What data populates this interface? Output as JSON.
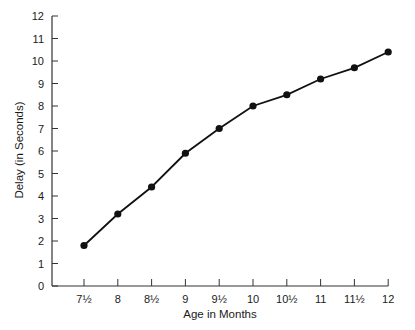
{
  "chart_data": {
    "type": "line",
    "title": "",
    "xlabel": "Age in Months",
    "ylabel": "Delay (in Seconds)",
    "x": [
      7.5,
      8,
      8.5,
      9,
      9.5,
      10,
      10.5,
      11,
      11.5,
      12
    ],
    "categories": [
      "7½",
      "8",
      "8½",
      "9",
      "9½",
      "10",
      "10½",
      "11",
      "11½",
      "12"
    ],
    "series": [
      {
        "name": "Delay",
        "values": [
          1.8,
          3.2,
          4.4,
          5.9,
          7.0,
          8.0,
          8.5,
          9.2,
          9.7,
          10.4
        ]
      }
    ],
    "ylim": [
      0,
      12
    ],
    "yticks": [
      0,
      1,
      2,
      3,
      4,
      5,
      6,
      7,
      8,
      9,
      10,
      11,
      12
    ],
    "grid": false,
    "legend": null,
    "marker": "filled-circle",
    "line_color": "#111111"
  }
}
